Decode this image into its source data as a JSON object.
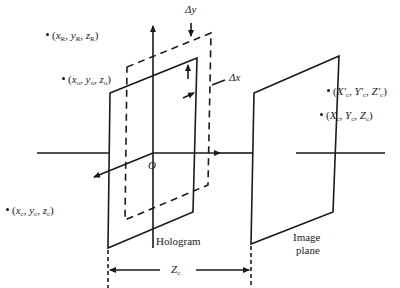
{
  "diagram": {
    "type": "hologram-geometry",
    "colors": {
      "stroke": "#1a1a1a",
      "background": "#ffffff"
    },
    "origin_label": "O",
    "delta_y_label": "Δy",
    "delta_x_label": "Δx",
    "distance_label": "Z",
    "distance_sub": "c",
    "hologram_label": "Hologram",
    "image_plane_label_line1": "Image",
    "image_plane_label_line2": "plane",
    "points": {
      "reference": {
        "x": "x",
        "xs": "R",
        "y": "y",
        "ys": "R",
        "z": "z",
        "zs": "R"
      },
      "object": {
        "x": "x",
        "xs": "o",
        "y": "y",
        "ys": "o",
        "z": "z",
        "zs": "o"
      },
      "reconstruction_source": {
        "x": "x",
        "xs": "c",
        "y": "y",
        "ys": "c",
        "z": "z",
        "zs": "c"
      },
      "image_point_prime": {
        "x": "X′",
        "xs": "c",
        "y": "Y′",
        "ys": "c",
        "z": "Z′",
        "zs": "c"
      },
      "image_point": {
        "x": "X",
        "xs": "c",
        "y": "Y",
        "ys": "c",
        "z": "Z",
        "zs": "c"
      }
    }
  }
}
